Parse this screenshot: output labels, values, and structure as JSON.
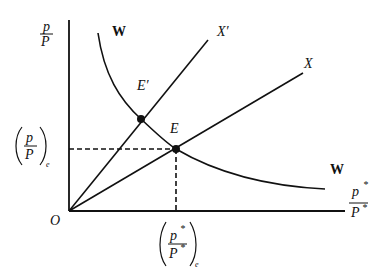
{
  "diagram": {
    "y_axis_label": {
      "num": "p",
      "den": "P"
    },
    "x_axis_label": {
      "num": "p",
      "num_sup": "*",
      "den": "P",
      "den_sup": "*"
    },
    "origin_label": "O",
    "y_equilibrium_label": {
      "num": "p",
      "den": "P",
      "sub": "e"
    },
    "x_equilibrium_label": {
      "num": "p",
      "num_sup": "*",
      "den": "P",
      "den_sup": "*",
      "sub": "e"
    },
    "curve_labels": {
      "w_top": "W",
      "w_bottom": "W",
      "x_prime": "X′",
      "x": "X"
    },
    "points": {
      "e": "E",
      "e_prime": "E′"
    },
    "colors": {
      "ink": "#111111",
      "background": "#ffffff"
    }
  }
}
